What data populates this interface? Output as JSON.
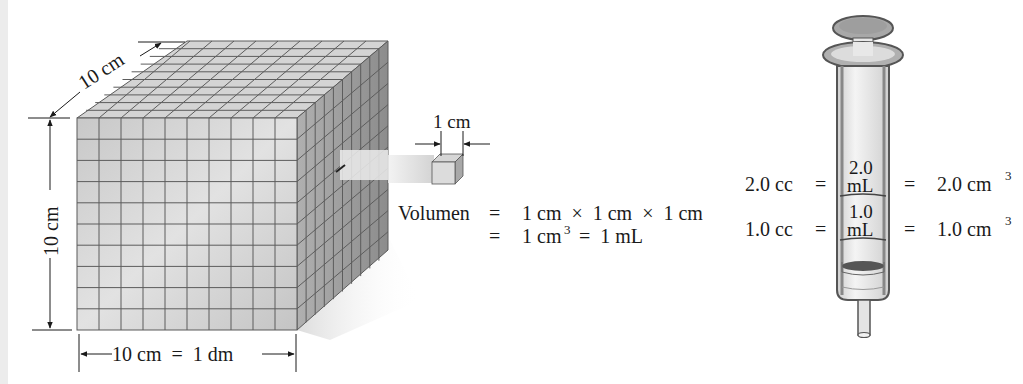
{
  "cube": {
    "depth_label": "10 cm",
    "height_label": "10 cm",
    "width_label": "10 cm  =  1 dm",
    "grid_divisions": 10
  },
  "small_cube": {
    "size_label": "1 cm"
  },
  "equation": {
    "line1_lhs": "Volumen",
    "line1_eq": "=",
    "line1_rhs": "1 cm  ×  1 cm  ×  1 cm",
    "line2_eq": "=",
    "line2_a": "1 cm",
    "line2_sup": "3",
    "line2_b": "=  1 mL"
  },
  "syringe": {
    "mark_upper": {
      "left": "2.0 cc",
      "eq_left": "=",
      "inner_value": "2.0",
      "inner_unit": "mL",
      "eq_right": "=",
      "right": "2.0 cm",
      "right_sup": "3"
    },
    "mark_lower": {
      "left": "1.0 cc",
      "eq_left": "=",
      "inner_value": "1.0",
      "inner_unit": "mL",
      "eq_right": "=",
      "right": "1.0 cm",
      "right_sup": "3"
    }
  },
  "colors": {
    "cube_face": "#cfcfcf",
    "cube_top": "#d8d8d8",
    "cube_side": "#9a9a9a",
    "grid_line": "#5a5a5a",
    "syringe_body": "#e6e6e6",
    "syringe_outline": "#555555",
    "text": "#1a1a1a"
  }
}
